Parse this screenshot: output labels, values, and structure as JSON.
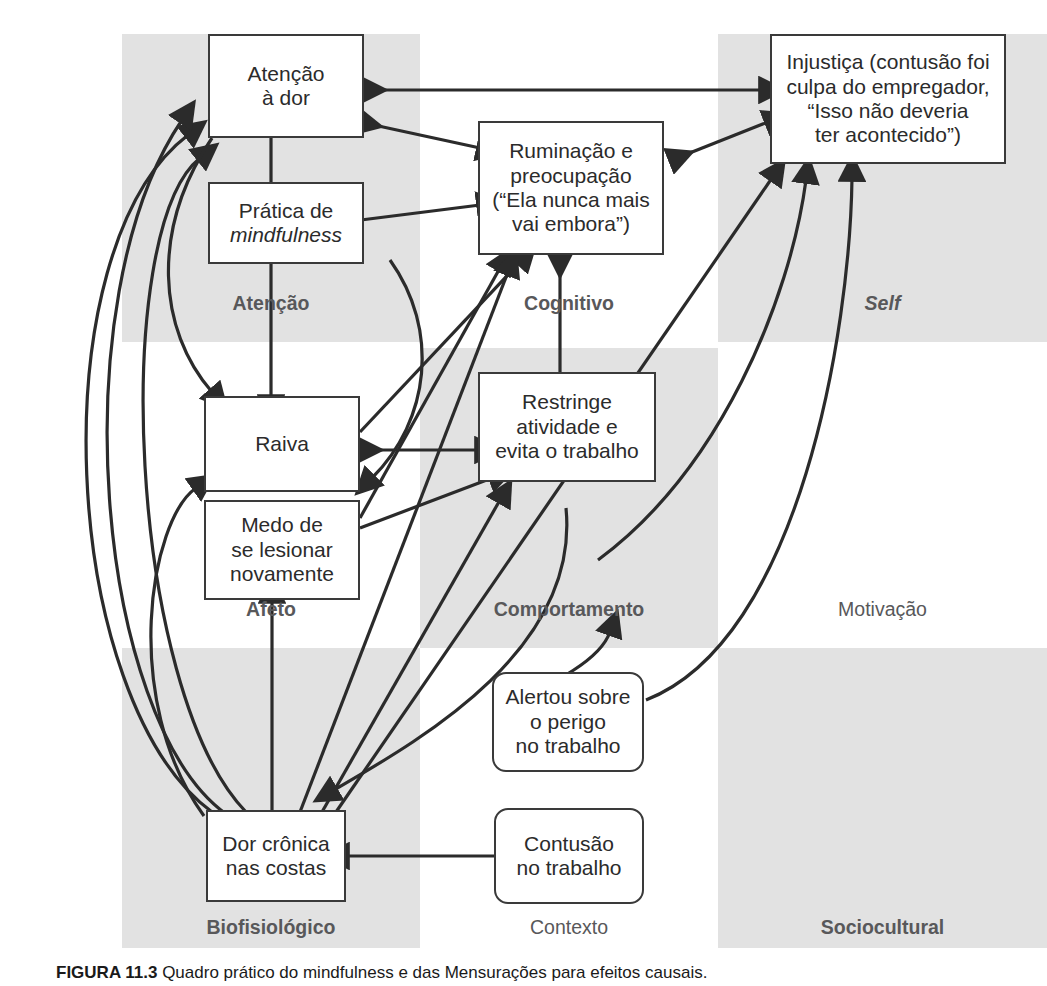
{
  "figure": {
    "caption_label": "FIGURA 11.3",
    "caption_text": "Quadro prático do mindfulness e das Mensurações para efeitos causais."
  },
  "colors": {
    "cell_gray": "#e2e2e2",
    "box_border": "#3a3a3a",
    "box_fill": "#ffffff",
    "arrow": "#2b2b2b",
    "label_text": "#58585a",
    "node_text": "#2b2b2b"
  },
  "grid": {
    "cells": [
      {
        "label": "Atenção",
        "style": "bold",
        "shaded": true,
        "col": 0,
        "row": 0
      },
      {
        "label": "Cognitivo",
        "style": "bold",
        "shaded": false,
        "col": 1,
        "row": 0
      },
      {
        "label": "Self",
        "style": "bold-italic",
        "shaded": true,
        "col": 2,
        "row": 0
      },
      {
        "label": "Afeto",
        "style": "bold",
        "shaded": false,
        "col": 0,
        "row": 1
      },
      {
        "label": "Comportamento",
        "style": "bold",
        "shaded": true,
        "col": 1,
        "row": 1
      },
      {
        "label": "Motivação",
        "style": "normal",
        "shaded": false,
        "col": 2,
        "row": 1
      },
      {
        "label": "Biofisiológico",
        "style": "bold",
        "shaded": true,
        "col": 0,
        "row": 2
      },
      {
        "label": "Contexto",
        "style": "normal",
        "shaded": false,
        "col": 1,
        "row": 2
      },
      {
        "label": "Sociocultural",
        "style": "bold",
        "shaded": true,
        "col": 2,
        "row": 2
      }
    ]
  },
  "nodes": {
    "atencao_dor": {
      "line1": "Atenção",
      "line2": "à dor"
    },
    "mindfulness": {
      "line1": "Prática de",
      "line2": "mindfulness"
    },
    "ruminacao": {
      "line1": "Ruminação e",
      "line2": "preocupação",
      "line3": "(“Ela nunca mais",
      "line4": "vai embora”)"
    },
    "injustica": {
      "line1": "Injustiça (contusão foi",
      "line2": "culpa do empregador,",
      "line3": "“Isso não deveria",
      "line4": "ter acontecido”)"
    },
    "raiva": {
      "line1": "Raiva"
    },
    "medo": {
      "line1": "Medo de",
      "line2": "se lesionar",
      "line3": "novamente"
    },
    "restringe": {
      "line1": "Restringe",
      "line2": "atividade e",
      "line3": "evita o trabalho"
    },
    "alertou": {
      "line1": "Alertou sobre",
      "line2": "o perigo",
      "line3": "no trabalho"
    },
    "dor_cronica": {
      "line1": "Dor crônica",
      "line2": "nas costas"
    },
    "contusao": {
      "line1": "Contusão",
      "line2": "no trabalho"
    }
  }
}
